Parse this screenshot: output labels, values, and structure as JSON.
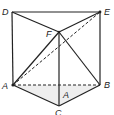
{
  "diagram": {
    "type": "geometry-prism",
    "stroke_color": "#222222",
    "shade_color": "#eeeeee",
    "labels": {
      "D": "D",
      "E": "E",
      "F": "F",
      "A": "A",
      "B": "B",
      "C": "C",
      "A2": "A"
    },
    "vertices": {
      "D": [
        12,
        12
      ],
      "E": [
        100,
        12
      ],
      "F": [
        59,
        32
      ],
      "A": [
        13,
        85
      ],
      "B": [
        100,
        85
      ],
      "C": [
        59,
        106
      ]
    },
    "solid_edges": [
      [
        "D",
        "E"
      ],
      [
        "D",
        "F"
      ],
      [
        "F",
        "E"
      ],
      [
        "D",
        "A"
      ],
      [
        "E",
        "B"
      ],
      [
        "F",
        "C"
      ],
      [
        "A",
        "C"
      ],
      [
        "C",
        "B"
      ],
      [
        "A",
        "F"
      ],
      [
        "F",
        "B"
      ]
    ],
    "dashed_edges": [
      [
        "A",
        "B"
      ],
      [
        "A",
        "E"
      ]
    ]
  }
}
